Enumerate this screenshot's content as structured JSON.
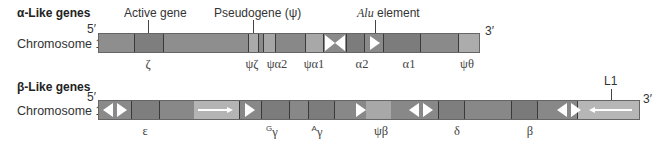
{
  "alpha": {
    "title": "α-Like genes",
    "chromosome": "Chromosome 16",
    "five_prime": "5′",
    "three_prime": "3′",
    "callouts": {
      "active_gene": "Active gene",
      "pseudogene": "Pseudogene (ψ)",
      "alu_italic": "Alu",
      "alu_rest": " element"
    },
    "genes": [
      {
        "label": "ζ",
        "x": 148
      },
      {
        "label": "ψζ",
        "x": 252
      },
      {
        "label": "ψα2",
        "x": 275
      },
      {
        "label": "ψα1",
        "x": 314
      },
      {
        "label": "α2",
        "x": 357
      },
      {
        "label": "α1",
        "x": 405
      },
      {
        "label": "ψθ",
        "x": 467
      }
    ]
  },
  "beta": {
    "title": "β-Like genes",
    "chromosome": "Chromosome 11",
    "five_prime": "5′",
    "three_prime": "3′",
    "callouts": {
      "l1": "L1"
    },
    "genes": [
      {
        "label": "ε",
        "sup": "",
        "x": 145
      },
      {
        "label": "γ",
        "sup": "G",
        "x": 271
      },
      {
        "label": "γ",
        "sup": "A",
        "x": 316
      },
      {
        "label": "ψβ",
        "sup": "",
        "x": 381
      },
      {
        "label": "δ",
        "sup": "",
        "x": 457
      },
      {
        "label": "β",
        "sup": "",
        "x": 530
      }
    ]
  },
  "colors": {
    "mid": "#8c8c8c",
    "dark": "#7a7a7a",
    "light": "#b0b0b0",
    "l1": "#b8b8b8"
  }
}
